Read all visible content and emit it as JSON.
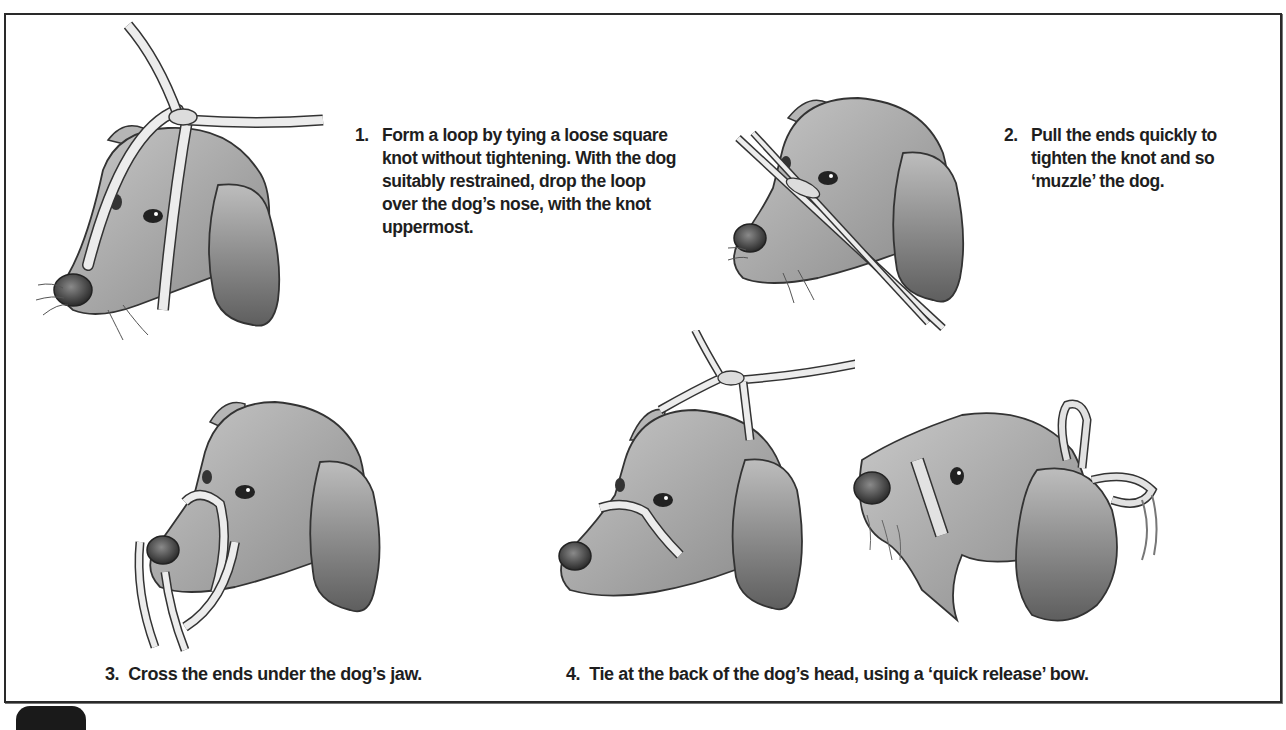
{
  "figure": {
    "colors": {
      "border": "#2a2a2a",
      "text": "#1e1e1e",
      "dog_fill": "#a9a9a9",
      "dog_shadow": "#6f6f6f",
      "tape_fill": "#e6e6e6",
      "outline": "#333333"
    },
    "steps": [
      {
        "number": "1.",
        "text": "Form a loop by tying a loose square knot without tightening. With the dog suitably restrained, drop the loop over the dog’s nose, with the knot uppermost.",
        "illustration": "dog-head-with-loose-loop"
      },
      {
        "number": "2.",
        "text": "Pull the ends quickly to tighten the knot and so ‘muzzle’ the dog.",
        "illustration": "dog-head-knot-tightened"
      },
      {
        "number": "3.",
        "text": "Cross the ends under the dog’s jaw.",
        "illustration": "dog-head-ends-crossed-under-jaw"
      },
      {
        "number": "4.",
        "text": "Tie at the back of the dog’s head, using a ‘quick release’ bow.",
        "illustration": [
          "dog-head-ends-tied-front-view",
          "dog-head-quick-release-bow-side-view"
        ]
      }
    ]
  }
}
